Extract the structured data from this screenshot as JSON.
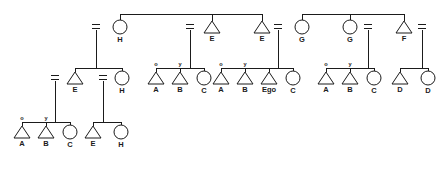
{
  "diagram": {
    "line_color": "#1b1b1b",
    "background": "#ffffff",
    "symbols": {
      "male": "triangle",
      "female": "circle",
      "marriage": "equals-sign",
      "older_sibling": "o",
      "younger_sibling": "y"
    },
    "generations": [
      {
        "id": "gen1",
        "nodes": [
          {
            "name": "node-g1-H",
            "shape": "circle",
            "label": "H",
            "x": 120,
            "y": 27,
            "married": true,
            "eq_x": 96
          },
          {
            "name": "node-g1-E1",
            "shape": "triangle",
            "label": "E",
            "x": 212,
            "y": 27,
            "married": true,
            "eq_x": 190
          },
          {
            "name": "node-g1-E2",
            "shape": "triangle",
            "label": "E",
            "x": 262,
            "y": 27,
            "married": true,
            "eq_x": 278
          },
          {
            "name": "node-g1-G1",
            "shape": "circle",
            "label": "G",
            "x": 302,
            "y": 27,
            "married": false,
            "eq_x": null
          },
          {
            "name": "node-g1-G2",
            "shape": "circle",
            "label": "G",
            "x": 350,
            "y": 27,
            "married": true,
            "eq_x": 368
          },
          {
            "name": "node-g1-F",
            "shape": "triangle",
            "label": "F",
            "x": 404,
            "y": 27,
            "married": true,
            "eq_x": 422
          }
        ],
        "sibling_bars": [
          {
            "name": "sibling-bar-left",
            "x1": 120,
            "x2": 262,
            "y": 14
          },
          {
            "name": "sibling-bar-right",
            "x1": 302,
            "x2": 404,
            "y": 14
          }
        ]
      },
      {
        "id": "gen2",
        "clusters": [
          {
            "name": "cluster-EH",
            "bar_y": 68,
            "bar_x1": 75,
            "bar_x2": 122,
            "stem_x": 99,
            "stem_from_y": 37,
            "children": [
              {
                "name": "node-g2-E",
                "shape": "triangle",
                "label": "E",
                "x": 75,
                "y": 78,
                "married": true,
                "eq_x": 55,
                "rank": null
              },
              {
                "name": "node-g2-H",
                "shape": "circle",
                "label": "H",
                "x": 122,
                "y": 78,
                "married": true,
                "eq_x": 103,
                "rank": null
              }
            ]
          },
          {
            "name": "cluster-ABC-left",
            "bar_y": 68,
            "bar_x1": 156,
            "bar_x2": 204,
            "stem_x": 193,
            "stem_from_y": 37,
            "children": [
              {
                "name": "node-g2-A1",
                "shape": "triangle",
                "label": "A",
                "x": 156,
                "y": 78,
                "married": false,
                "eq_x": null,
                "rank": "o"
              },
              {
                "name": "node-g2-B1",
                "shape": "triangle",
                "label": "B",
                "x": 180,
                "y": 78,
                "married": false,
                "eq_x": null,
                "rank": "y"
              },
              {
                "name": "node-g2-C1",
                "shape": "circle",
                "label": "C",
                "x": 204,
                "y": 78,
                "married": false,
                "eq_x": null,
                "rank": null
              }
            ]
          },
          {
            "name": "cluster-AB-Ego-C",
            "bar_y": 68,
            "bar_x1": 221,
            "bar_x2": 293,
            "stem_x": 281,
            "stem_from_y": 37,
            "children": [
              {
                "name": "node-g2-A2",
                "shape": "triangle",
                "label": "A",
                "x": 221,
                "y": 78,
                "married": false,
                "eq_x": null,
                "rank": "o"
              },
              {
                "name": "node-g2-B2",
                "shape": "triangle",
                "label": "B",
                "x": 245,
                "y": 78,
                "married": false,
                "eq_x": null,
                "rank": "y"
              },
              {
                "name": "node-g2-Ego",
                "shape": "triangle",
                "label": "Ego",
                "x": 269,
                "y": 78,
                "married": false,
                "eq_x": null,
                "rank": null
              },
              {
                "name": "node-g2-C2",
                "shape": "circle",
                "label": "C",
                "x": 293,
                "y": 78,
                "married": false,
                "eq_x": null,
                "rank": null
              }
            ]
          },
          {
            "name": "cluster-ABC-right",
            "bar_y": 68,
            "bar_x1": 326,
            "bar_x2": 374,
            "stem_x": 371,
            "stem_from_y": 37,
            "children": [
              {
                "name": "node-g2-A3",
                "shape": "triangle",
                "label": "A",
                "x": 326,
                "y": 78,
                "married": false,
                "eq_x": null,
                "rank": "o"
              },
              {
                "name": "node-g2-B3",
                "shape": "triangle",
                "label": "B",
                "x": 350,
                "y": 78,
                "married": false,
                "eq_x": null,
                "rank": "y"
              },
              {
                "name": "node-g2-C3",
                "shape": "circle",
                "label": "C",
                "x": 374,
                "y": 78,
                "married": false,
                "eq_x": null,
                "rank": null
              }
            ]
          },
          {
            "name": "cluster-DD",
            "bar_y": 68,
            "bar_x1": 400,
            "bar_x2": 428,
            "stem_x": 425,
            "stem_from_y": 37,
            "children": [
              {
                "name": "node-g2-D1",
                "shape": "triangle",
                "label": "D",
                "x": 400,
                "y": 78,
                "married": false,
                "eq_x": null,
                "rank": null
              },
              {
                "name": "node-g2-D2",
                "shape": "circle",
                "label": "D",
                "x": 428,
                "y": 78,
                "married": false,
                "eq_x": null,
                "rank": null
              }
            ]
          }
        ]
      },
      {
        "id": "gen3",
        "clusters": [
          {
            "name": "cluster-ABC-bottom",
            "bar_y": 122,
            "bar_x1": 22,
            "bar_x2": 70,
            "stem_x": 58,
            "stem_from_y": 88,
            "children": [
              {
                "name": "node-g3-A",
                "shape": "triangle",
                "label": "A",
                "x": 22,
                "y": 132,
                "rank": "o"
              },
              {
                "name": "node-g3-B",
                "shape": "triangle",
                "label": "B",
                "x": 46,
                "y": 132,
                "rank": "y"
              },
              {
                "name": "node-g3-C",
                "shape": "circle",
                "label": "C",
                "x": 70,
                "y": 132,
                "rank": null
              }
            ]
          },
          {
            "name": "cluster-EH-bottom",
            "bar_y": 122,
            "bar_x1": 93,
            "bar_x2": 121,
            "stem_x": 106,
            "stem_from_y": 88,
            "children": [
              {
                "name": "node-g3-E",
                "shape": "triangle",
                "label": "E",
                "x": 93,
                "y": 132,
                "rank": null
              },
              {
                "name": "node-g3-H",
                "shape": "circle",
                "label": "H",
                "x": 121,
                "y": 132,
                "rank": null
              }
            ]
          }
        ]
      }
    ]
  }
}
